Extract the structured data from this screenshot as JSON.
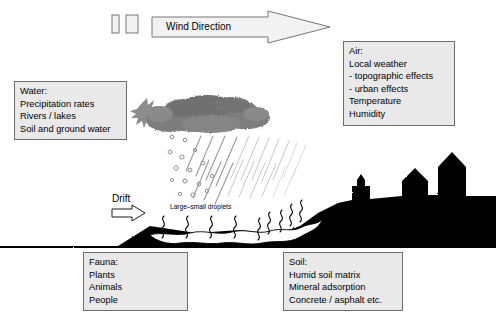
{
  "figure": {
    "kind": "environmental-pathways-diagram",
    "background_color": "#ffffff",
    "box_fill_color": "#e9e9e9",
    "box_border_color": "#6e6e6e",
    "silhouette_color": "#000000",
    "spray_cloud_color": "#808080",
    "text_color": "#000000"
  },
  "wind": {
    "label": "Wind Direction",
    "arrow_direction": "right",
    "marker_count": 2
  },
  "drift": {
    "label": "Drift",
    "arrow_direction": "right"
  },
  "droplets": {
    "label": "Large–small droplets"
  },
  "boxes": {
    "water": {
      "title": "Water:",
      "items": [
        "Precipitation rates",
        "Rivers / lakes",
        "Soil and ground water"
      ]
    },
    "air": {
      "title": "Air:",
      "items": [
        "Local weather",
        "- topographic effects",
        "- urban effects",
        "Temperature",
        "Humidity"
      ]
    },
    "fauna": {
      "title": "Fauna:",
      "items": [
        "Plants",
        "Animals",
        "People"
      ]
    },
    "soil": {
      "title": "Soil:",
      "items": [
        "Humid soil matrix",
        "Mineral adsorption",
        "Concrete / asphalt etc."
      ]
    }
  },
  "scene": {
    "spray_nozzle": "starburst-spray-origin",
    "spray_cloud": "gray-stippled-cloud",
    "falling_droplets": "small-circle-droplets",
    "rain_streaks": "diagonal-rain-lines",
    "ground": "black-terrain-silhouette",
    "water_body": "white-pond-surface",
    "vapor": "white-squiggle-evaporation",
    "buildings": [
      "small-tower-silhouette",
      "house-silhouette",
      "tall-building-silhouette"
    ]
  }
}
